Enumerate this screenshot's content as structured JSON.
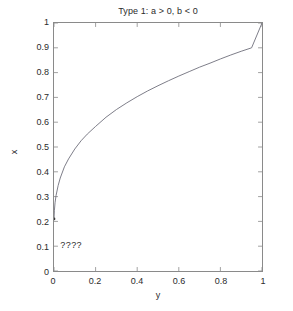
{
  "figure": {
    "title": "Type 1:  a > 0, b < 0",
    "background_color": "#ffffff",
    "axis_color": "#8a8a8a",
    "text_color": "#2b2b2b",
    "curve_color": "#6e6e7a",
    "width": 293,
    "height": 311
  },
  "annotation": {
    "text": "????",
    "x_value": 0.035,
    "y_value": 0.105
  },
  "labels": {
    "xlabel": "y",
    "ylabel": "x"
  },
  "chart_data": {
    "type": "line",
    "title": "Type 1:  a > 0, b < 0",
    "xlabel": "y",
    "ylabel": "x",
    "xlim": [
      0,
      1
    ],
    "ylim": [
      0,
      1
    ],
    "grid": false,
    "legend": "none",
    "xticks": [
      0,
      0.2,
      0.4,
      0.6,
      0.8,
      1
    ],
    "xtick_labels": [
      "0",
      "0.2",
      "0.4",
      "0.6",
      "0.8",
      "1"
    ],
    "yticks": [
      0,
      0.1,
      0.2,
      0.3,
      0.4,
      0.5,
      0.6,
      0.7,
      0.8,
      0.9,
      1
    ],
    "ytick_labels": [
      "0",
      "0.1",
      "0.2",
      "0.3",
      "0.4",
      "0.5",
      "0.6",
      "0.7",
      "0.8",
      "0.9",
      "1"
    ],
    "series": [
      {
        "name": "Type 1 curve",
        "marker_at_start": true,
        "x": [
          0.0,
          0.002,
          0.005,
          0.01,
          0.02,
          0.03,
          0.05,
          0.07,
          0.1,
          0.13,
          0.16,
          0.2,
          0.25,
          0.3,
          0.35,
          0.4,
          0.45,
          0.5,
          0.55,
          0.6,
          0.65,
          0.7,
          0.75,
          0.8,
          0.85,
          0.9,
          0.95,
          1.0
        ],
        "y": [
          0.21,
          0.245,
          0.275,
          0.305,
          0.345,
          0.375,
          0.42,
          0.452,
          0.492,
          0.525,
          0.552,
          0.583,
          0.62,
          0.651,
          0.678,
          0.703,
          0.726,
          0.747,
          0.767,
          0.786,
          0.804,
          0.822,
          0.838,
          0.855,
          0.871,
          0.886,
          0.9,
          1.0
        ]
      }
    ]
  }
}
